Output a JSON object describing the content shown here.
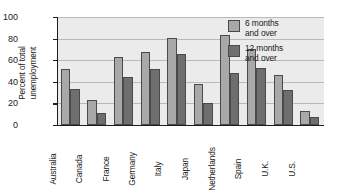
{
  "chart_data": {
    "type": "bar",
    "title": "",
    "xlabel": "",
    "ylabel": "Percent of total\nunemployment",
    "ylim": [
      0,
      100
    ],
    "yticks": [
      0,
      20,
      40,
      60,
      80,
      100
    ],
    "grid": true,
    "legend_position": "top-right",
    "categories": [
      "Australia",
      "Canada",
      "France",
      "Germany",
      "Italy",
      "Japan",
      "Netherlands",
      "Spain",
      "U.K.",
      "U.S."
    ],
    "series": [
      {
        "name": "6 months\nand over",
        "color": "#a8a8a8",
        "values": [
          52,
          23,
          63,
          68,
          81,
          38,
          83,
          70,
          46,
          13
        ]
      },
      {
        "name": "12 months\nand over",
        "color": "#6e6e6e",
        "values": [
          33,
          11,
          44,
          52,
          66,
          20,
          48,
          53,
          32,
          7
        ]
      }
    ]
  },
  "colors": {
    "plot_background": "#ebebeb",
    "axis": "#1d1d1d",
    "gridline": "#b9b9b9",
    "series_6_months": "#a8a8a8",
    "series_12_months": "#6e6e6e"
  }
}
